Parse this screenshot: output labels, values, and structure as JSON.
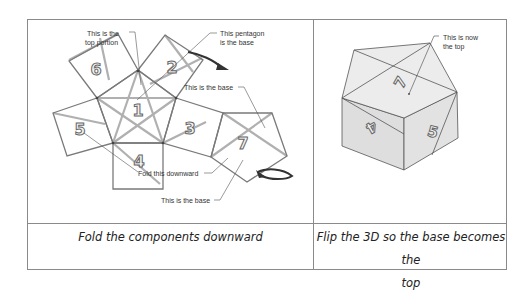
{
  "net_diagram": {
    "faces": [
      {
        "id": "face-1",
        "label": "1"
      },
      {
        "id": "face-2",
        "label": "2"
      },
      {
        "id": "face-3",
        "label": "3"
      },
      {
        "id": "face-4",
        "label": "4"
      },
      {
        "id": "face-5",
        "label": "5"
      },
      {
        "id": "face-6",
        "label": "6"
      },
      {
        "id": "face-7",
        "label": "7"
      }
    ],
    "annotations": {
      "top_portion_line1": "This is the",
      "top_portion_line2": "top portion",
      "pentagon_base_line1": "This pentagon",
      "pentagon_base_line2": "is the base",
      "base_upper": "This is the base",
      "fold_downward": "Fold this downward",
      "base_lower": "This is the base"
    },
    "colors": {
      "edge": "#7a7a7a",
      "fold_line": "#a8a8a8",
      "arrow": "#333333"
    }
  },
  "solid_diagram": {
    "faces": [
      {
        "id": "top-face",
        "label": "7"
      },
      {
        "id": "left-face",
        "label": "4"
      },
      {
        "id": "right-face",
        "label": "5"
      }
    ],
    "annotations": {
      "now_top_line1": "This is now",
      "now_top_line2": "the top"
    },
    "colors": {
      "top_face": "#ececec",
      "side_face": "#dedede",
      "edge": "#555555"
    }
  },
  "captions": {
    "left": "Fold the components downward",
    "right_line1": "Flip the 3D so the base becomes the",
    "right_line2": "top"
  }
}
